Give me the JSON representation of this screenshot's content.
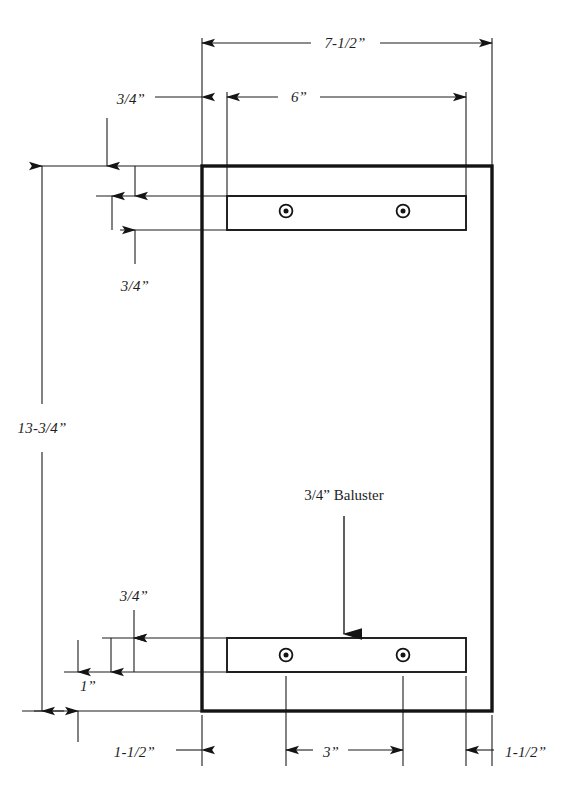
{
  "drawing": {
    "title": "Newel post / baluster rail assembly dimensioned drawing",
    "units": "inches",
    "dimensions": {
      "overall_width": "7-1/2”",
      "inner_width": "6”",
      "overall_height": "13-3/4”",
      "top_offset": "3/4”",
      "top_rail_thickness": "3/4”",
      "left_offset": "3/4”",
      "bottom_rail_offset": "3/4”",
      "bottom_offset": "1”",
      "bottom_left_inset": "1-1/2”",
      "bottom_center_span": "3”",
      "bottom_right_inset": "1-1/2”"
    },
    "labels": {
      "baluster": "3/4” Baluster"
    },
    "parts": {
      "post_outline": "post-outline",
      "top_rail": "top-rail",
      "bottom_rail": "bottom-rail",
      "screws": [
        {
          "name": "screw-top-left"
        },
        {
          "name": "screw-top-right"
        },
        {
          "name": "screw-bottom-left"
        },
        {
          "name": "screw-bottom-right"
        }
      ]
    },
    "colors": {
      "ink": "#141414",
      "paper": "#ffffff",
      "line": "#1c1c1c"
    }
  }
}
